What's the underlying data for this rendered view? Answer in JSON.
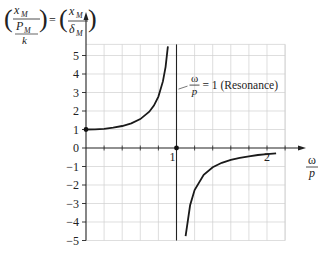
{
  "chart_data": {
    "type": "line",
    "title": "",
    "ylabel": {
      "lhs_num_top": "x",
      "lhs_num_top_sub": "M",
      "lhs_mid": "P",
      "lhs_mid_sub": "M",
      "lhs_den": "k",
      "equals": "=",
      "rhs_num": "x",
      "rhs_num_sub": "M",
      "rhs_den": "δ",
      "rhs_den_sub": "M"
    },
    "xlabel": {
      "num": "ω",
      "den": "p"
    },
    "xlim": [
      0,
      2.2
    ],
    "ylim": [
      -5,
      5.6
    ],
    "x_ticks": [
      {
        "value": 1,
        "label": "1"
      },
      {
        "value": 2,
        "label": "2"
      }
    ],
    "x_minor_step": 0.2,
    "y_ticks": [
      {
        "value": 5,
        "label": "5"
      },
      {
        "value": 4,
        "label": "4"
      },
      {
        "value": 3,
        "label": "3"
      },
      {
        "value": 2,
        "label": "2"
      },
      {
        "value": 1,
        "label": "1"
      },
      {
        "value": 0,
        "label": "0"
      },
      {
        "value": -1,
        "label": "−1"
      },
      {
        "value": -2,
        "label": "−2"
      },
      {
        "value": -3,
        "label": "−3"
      },
      {
        "value": -4,
        "label": "−4"
      },
      {
        "value": -5,
        "label": "−5"
      }
    ],
    "grid": true,
    "series": [
      {
        "name": "below-resonance",
        "function": "1/(1-r^2)",
        "x": [
          0,
          0.1,
          0.2,
          0.3,
          0.4,
          0.5,
          0.6,
          0.7,
          0.75,
          0.8,
          0.85,
          0.88,
          0.9,
          0.905
        ],
        "y": [
          1.0,
          1.01,
          1.04,
          1.1,
          1.19,
          1.33,
          1.56,
          1.96,
          2.29,
          2.78,
          3.6,
          4.39,
          5.26,
          5.5
        ]
      },
      {
        "name": "above-resonance",
        "function": "1/(1-r^2)",
        "x": [
          1.1,
          1.15,
          1.2,
          1.3,
          1.4,
          1.5,
          1.6,
          1.7,
          1.8,
          1.9,
          2.0,
          2.1
        ],
        "y": [
          -4.76,
          -3.1,
          -2.27,
          -1.45,
          -1.04,
          -0.8,
          -0.64,
          -0.53,
          -0.45,
          -0.38,
          -0.33,
          -0.29
        ]
      }
    ],
    "points": [
      {
        "name": "start-point",
        "x": 0,
        "y": 1
      },
      {
        "name": "resonance-point",
        "x": 1,
        "y": 0
      }
    ],
    "annotations": [
      {
        "name": "resonance-label",
        "num": "ω",
        "den": "p",
        "text": "= 1 (Resonance)",
        "x": 1.0,
        "y": 3.4
      }
    ]
  }
}
